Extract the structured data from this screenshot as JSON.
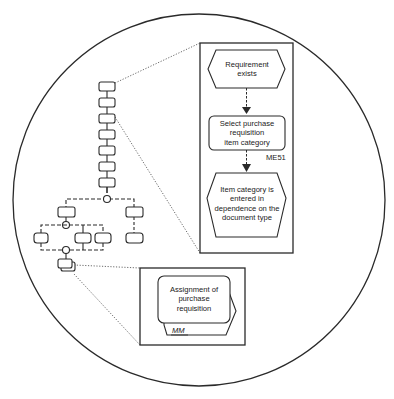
{
  "diagram": {
    "type": "process-chain-zoom-illustration",
    "colors": {
      "stroke": "#2a2a2a",
      "background": "#ffffff",
      "text": "#222222"
    },
    "callout_detail": {
      "steps": [
        {
          "kind": "event",
          "label": "Requirement exists"
        },
        {
          "kind": "function",
          "label": "Select purchase requisition item category",
          "transaction": "ME51"
        },
        {
          "kind": "event",
          "label": "Item category is entered in dependence on the document type"
        }
      ]
    },
    "callout_process": {
      "kind": "process-path",
      "label": "Assignment of purchase requisition",
      "module": "MM"
    },
    "overview_chain": {
      "linear_nodes": 7,
      "branch_connectors": 3
    }
  },
  "labels": {
    "event1_line1": "Requirement",
    "event1_line2": "exists",
    "func_line1": "Select purchase",
    "func_line2": "requisition",
    "func_line3": "item category",
    "transaction": "ME51",
    "event2_line1": "Item category is",
    "event2_line2": "entered in",
    "event2_line3": "dependence on the",
    "event2_line4": "document type",
    "proc_line1": "Assignment of",
    "proc_line2": "purchase",
    "proc_line3": "requisition",
    "module": "MM"
  }
}
